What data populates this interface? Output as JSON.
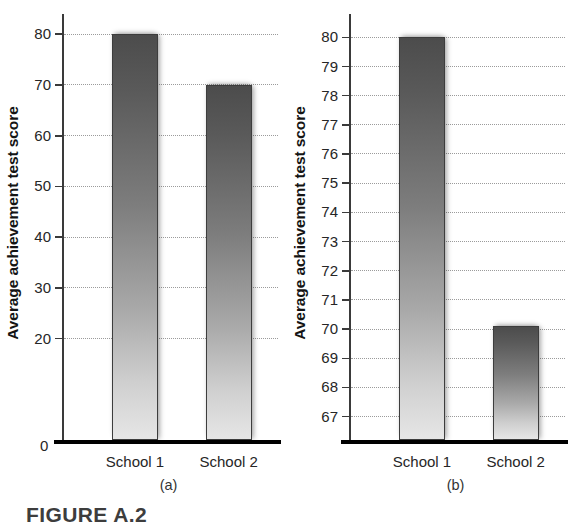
{
  "figure": {
    "caption": "FIGURE A.2",
    "y_axis_title": "Average achievement test score",
    "panels": [
      {
        "letter": "(a)",
        "y_label_zero": "0",
        "ticks": [
          "80",
          "70",
          "60",
          "50",
          "40",
          "30",
          "20"
        ],
        "categories": [
          "School 1",
          "School 2"
        ]
      },
      {
        "letter": "(b)",
        "ticks": [
          "80",
          "79",
          "78",
          "77",
          "76",
          "75",
          "74",
          "73",
          "72",
          "71",
          "70",
          "69",
          "68",
          "67"
        ],
        "categories": [
          "School 1",
          "School 2"
        ]
      }
    ]
  },
  "chart_data": [
    {
      "type": "bar",
      "panel": "(a)",
      "title": "",
      "xlabel": "",
      "ylabel": "Average achievement test score",
      "categories": [
        "School 1",
        "School 2"
      ],
      "values": [
        80,
        70
      ],
      "ylim": [
        0,
        84
      ],
      "yticks": [
        20,
        30,
        40,
        50,
        60,
        70,
        80
      ],
      "ytick_labels": [
        "20",
        "30",
        "40",
        "50",
        "60",
        "70",
        "80"
      ],
      "zero_baseline_label": "0",
      "axis_truncated": false,
      "grid": true,
      "grid_style": "dotted",
      "legend": "none",
      "note": "Full y-axis starting at zero; the 10-point gap between schools appears modest."
    },
    {
      "type": "bar",
      "panel": "(b)",
      "title": "",
      "xlabel": "",
      "ylabel": "Average achievement test score",
      "categories": [
        "School 1",
        "School 2"
      ],
      "values": [
        80,
        70.1
      ],
      "ylim": [
        66.2,
        80.8
      ],
      "yticks": [
        67,
        68,
        69,
        70,
        71,
        72,
        73,
        74,
        75,
        76,
        77,
        78,
        79,
        80
      ],
      "ytick_labels": [
        "67",
        "68",
        "69",
        "70",
        "71",
        "72",
        "73",
        "74",
        "75",
        "76",
        "77",
        "78",
        "79",
        "80"
      ],
      "axis_truncated": true,
      "grid": true,
      "grid_style": "dotted",
      "legend": "none",
      "note": "Same data as panel (a) but the y-axis is truncated near 66, exaggerating the difference."
    }
  ]
}
